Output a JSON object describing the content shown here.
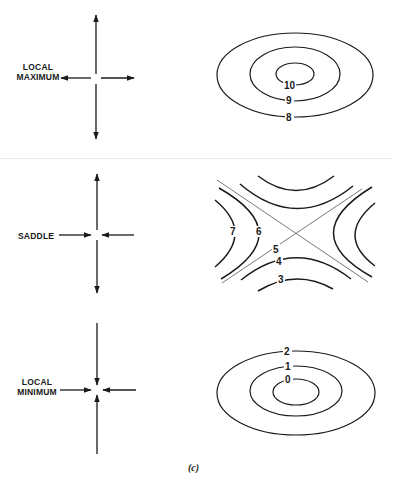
{
  "figure": {
    "caption": "(c)",
    "panels": [
      {
        "id": "local-maximum",
        "label_line1": "LOCAL",
        "label_line2": "MAXIMUM",
        "arrows": "all outward",
        "contours": [
          "10",
          "9",
          "8"
        ]
      },
      {
        "id": "saddle",
        "label_line1": "SADDLE",
        "arrows": "vertical outward, horizontal inward",
        "contours": [
          "7",
          "6",
          "5",
          "4",
          "3"
        ]
      },
      {
        "id": "local-minimum",
        "label_line1": "LOCAL",
        "label_line2": "MINIMUM",
        "arrows": "all inward",
        "contours": [
          "2",
          "1",
          "0"
        ]
      }
    ]
  },
  "colors": {
    "ink": "#1a1a1a",
    "thin_line": "#555555",
    "divider": "#ececec",
    "background": "#ffffff"
  }
}
